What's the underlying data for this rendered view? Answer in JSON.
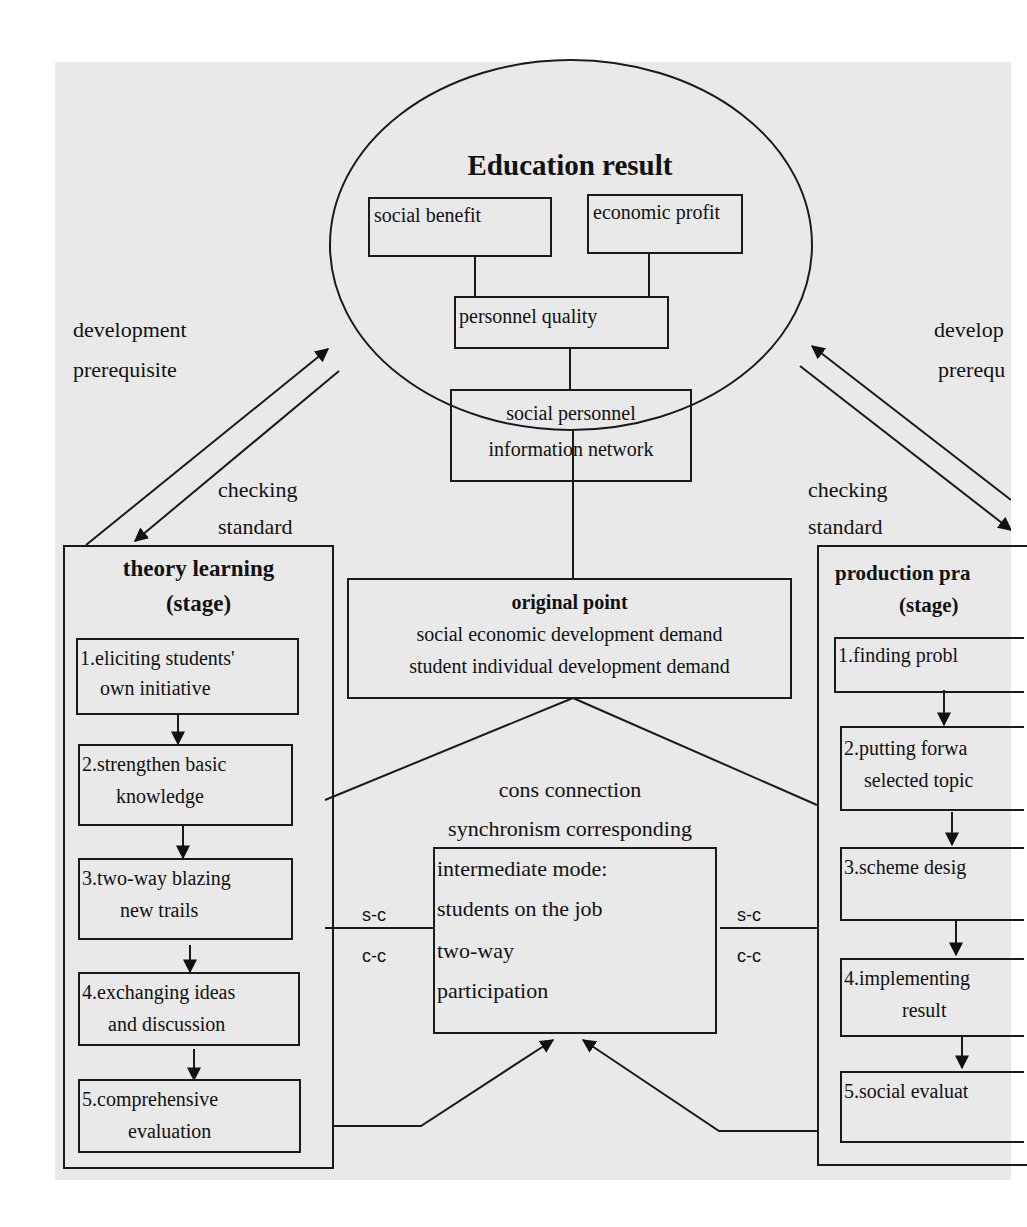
{
  "diagram": {
    "education_result": {
      "title": "Education result",
      "social_benefit": "social benefit",
      "economic_profit": "economic profit",
      "personnel_quality": "personnel quality",
      "network_line1": "social personnel",
      "network_line2": "information network"
    },
    "left_labels": {
      "development_line1": "development",
      "development_line2": "prerequisite",
      "checking_line1": "checking",
      "checking_line2": "standard"
    },
    "right_labels": {
      "development_line1": "develop",
      "development_line2": "prerequ",
      "checking_line1": "checking",
      "checking_line2": "standard"
    },
    "original_point": {
      "title": "original point",
      "line1": "social economic development demand",
      "line2": "student individual development demand"
    },
    "connection": {
      "line1": "cons connection",
      "line2": "synchronism corresponding"
    },
    "intermediate": {
      "line1": "intermediate mode:",
      "line2": "students on the job",
      "line3": "two-way",
      "line4": "participation"
    },
    "link_labels": {
      "left_top": "s-c",
      "left_bottom": "c-c",
      "right_top": "s-c",
      "right_bottom": "c-c"
    },
    "theory_learning": {
      "title": "theory learning",
      "subtitle": "(stage)",
      "steps": [
        {
          "line1": "1.eliciting students'",
          "line2": "own initiative"
        },
        {
          "line1": "2.strengthen basic",
          "line2": "knowledge"
        },
        {
          "line1": "3.two-way blazing",
          "line2": "new trails"
        },
        {
          "line1": "4.exchanging ideas",
          "line2": "and discussion"
        },
        {
          "line1": "5.comprehensive",
          "line2": "evaluation"
        }
      ]
    },
    "production_practice": {
      "title": "production pra",
      "subtitle": "(stage)",
      "steps": [
        {
          "line1": "1.finding  probl",
          "line2": ""
        },
        {
          "line1": "2.putting forwa",
          "line2": "selected topic"
        },
        {
          "line1": "3.scheme desig",
          "line2": ""
        },
        {
          "line1": "4.implementing",
          "line2": "result"
        },
        {
          "line1": "5.social evaluat",
          "line2": ""
        }
      ]
    }
  }
}
